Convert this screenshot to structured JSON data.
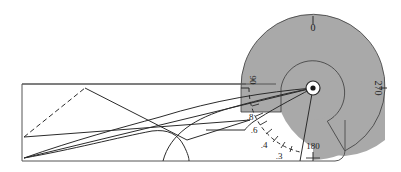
{
  "figure": {
    "name": "mechanism-kinematic-diagram",
    "background_color": "#ffffff",
    "shaded_color": "#a9a9a9",
    "line_color": "#2b2b2b"
  },
  "angle_scale": {
    "name": "outer-angle-dial",
    "ticks": [
      {
        "label": "0",
        "rotation": 0
      },
      {
        "label": "270",
        "rotation": 90
      },
      {
        "label": "180",
        "rotation": 0
      },
      {
        "label": "90",
        "rotation": 90
      }
    ]
  },
  "radius_scale": {
    "name": "inner-radius-arc",
    "ticks": [
      {
        "label": ".8"
      },
      {
        "label": ".6"
      },
      {
        "label": ".4"
      },
      {
        "label": ".3"
      }
    ]
  },
  "hub": {
    "name": "pivot-hub",
    "cx": 313,
    "cy": 88
  },
  "frame": {
    "name": "body-outline",
    "left": 22,
    "top": 84,
    "right": 345,
    "bottom": 161
  }
}
